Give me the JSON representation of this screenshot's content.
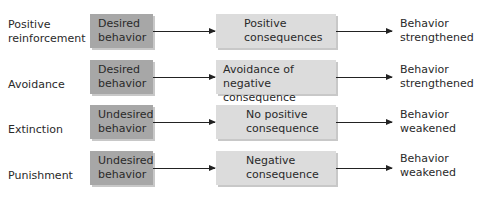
{
  "diagram": {
    "rows": [
      {
        "type": "Positive reinforcement",
        "type_lines": [
          "Positive",
          "reinforcement"
        ],
        "behavior_lines": [
          "Desired",
          "behavior"
        ],
        "consequence_lines": [
          "Positive",
          "consequences"
        ],
        "result_lines": [
          "Behavior",
          "strengthened"
        ]
      },
      {
        "type": "Avoidance",
        "type_lines": [
          "Avoidance"
        ],
        "behavior_lines": [
          "Desired",
          "behavior"
        ],
        "consequence_lines": [
          "Avoidance of",
          "negative consequence"
        ],
        "result_lines": [
          "Behavior",
          "strengthened"
        ]
      },
      {
        "type": "Extinction",
        "type_lines": [
          "Extinction"
        ],
        "behavior_lines": [
          "Undesired",
          "behavior"
        ],
        "consequence_lines": [
          "No positive",
          "consequence"
        ],
        "result_lines": [
          "Behavior",
          "weakened"
        ]
      },
      {
        "type": "Punishment",
        "type_lines": [
          "Punishment"
        ],
        "behavior_lines": [
          "Undesired",
          "behavior"
        ],
        "consequence_lines": [
          "Negative",
          "consequence"
        ],
        "result_lines": [
          "Behavior",
          "weakened"
        ]
      }
    ],
    "colors": {
      "behavior_box": "#a7a7a7",
      "consequence_box": "#dcdcdc",
      "arrow": "#222222"
    }
  }
}
